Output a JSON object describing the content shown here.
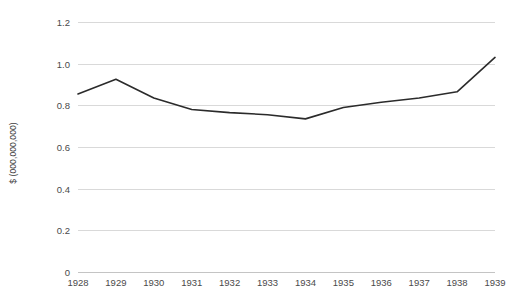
{
  "chart_data": {
    "type": "line",
    "title": "",
    "subtitle": "",
    "xlabel": "",
    "ylabel": "$ (000,000,000)",
    "categories": [
      "1928",
      "1929",
      "1930",
      "1931",
      "1932",
      "1933",
      "1934",
      "1935",
      "1936",
      "1937",
      "1938",
      "1939"
    ],
    "x": [
      1928,
      1929,
      1930,
      1931,
      1932,
      1933,
      1934,
      1935,
      1936,
      1937,
      1938,
      1939
    ],
    "values": [
      0.855,
      0.925,
      0.835,
      0.78,
      0.765,
      0.755,
      0.735,
      0.79,
      0.815,
      0.835,
      0.865,
      1.03
    ],
    "series": [
      {
        "name": "",
        "values": [
          0.855,
          0.925,
          0.835,
          0.78,
          0.765,
          0.755,
          0.735,
          0.79,
          0.815,
          0.835,
          0.865,
          1.03
        ],
        "color": "#2b2b2b"
      }
    ],
    "ylim": [
      0,
      1.2
    ],
    "y_ticks": [
      0,
      0.2,
      0.4,
      0.6,
      0.8,
      1.0,
      1.2
    ],
    "y_tick_labels": [
      "0",
      "0.2",
      "0.4",
      "0.6",
      "0.8",
      "1.0",
      "1.2"
    ],
    "grid": true,
    "grid_axis": "y",
    "legend": false,
    "legend_position": "none",
    "markers": false,
    "line_width": 1.6,
    "background": "#ffffff",
    "gridline_color": "#d9d9d9",
    "axis_color": "#c4c4c4",
    "text_color": "#4a4a4a"
  }
}
